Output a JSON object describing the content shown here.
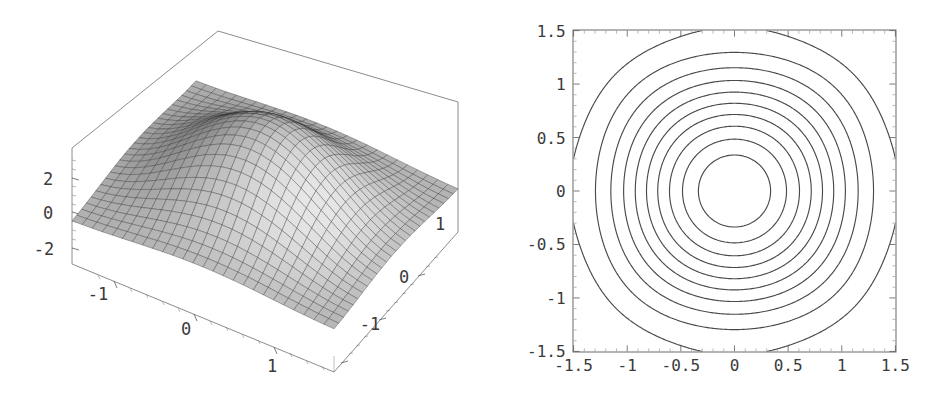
{
  "figure": {
    "background": "#ffffff",
    "ink": "#3a3a3a",
    "panels": [
      "surface-plot",
      "contour-plot"
    ]
  },
  "surface_plot": {
    "name": "3d-surface-plot",
    "z_axis": {
      "ticks": [
        "2",
        "0",
        "-2"
      ],
      "values": [
        2,
        0,
        -2
      ]
    },
    "x_axis": {
      "ticks": [
        "-1",
        "0",
        "1"
      ],
      "values": [
        -1,
        0,
        1
      ]
    },
    "y_axis": {
      "ticks": [
        "1",
        "0",
        "-1"
      ],
      "values": [
        1,
        0,
        -1
      ]
    },
    "mesh": {
      "face_color": "#b9b9b9",
      "line_color": "#2b2b2b",
      "rows": 26,
      "cols": 26
    },
    "box_color": "#6e6e6e"
  },
  "chart_data": {
    "type": "line",
    "title": "",
    "subtitle": "",
    "xlabel": "",
    "ylabel": "",
    "grid": false,
    "legend": null,
    "panels": [
      {
        "id": "surface",
        "type": "surface",
        "description": "3D mesh surface over square domain with four extrema; saddle ridges run diagonally",
        "xlim": [
          -1.5,
          1.5
        ],
        "ylim": [
          -1.5,
          1.5
        ],
        "zlim": [
          -3,
          3
        ],
        "xticks": [
          -1,
          0,
          1
        ],
        "yticks": [
          1,
          0,
          -1
        ],
        "zticks": [
          2,
          0,
          -2
        ],
        "xticklabels": [
          "-1",
          "0",
          "1"
        ],
        "yticklabels": [
          "1",
          "0",
          "-1"
        ],
        "zticklabels": [
          "2",
          "0",
          "-2"
        ]
      },
      {
        "id": "contour",
        "type": "contour",
        "description": "Contour map with closed maxima loops at (0,1), (-1,-1), (1,-1) and saddles near (±1,±1) corners",
        "xlim": [
          -1.5,
          1.5
        ],
        "ylim": [
          -1.5,
          1.5
        ],
        "xticks": [
          -1.5,
          -1,
          -0.5,
          0,
          0.5,
          1,
          1.5
        ],
        "yticks": [
          -1.5,
          -1,
          -0.5,
          0,
          0.5,
          1,
          1.5
        ],
        "xticklabels": [
          "-1.5",
          "-1",
          "-0.5",
          "0",
          "0.5",
          "1",
          "1.5"
        ],
        "yticklabels": [
          "-1.5",
          "-1",
          "-0.5",
          "0",
          "0.5",
          "1",
          "1.5"
        ],
        "minor_ticks_per_interval": 5,
        "n_levels": 10,
        "line_color": "#4a4a4a",
        "frame": true,
        "closed_loop_centers": [
          [
            0,
            1
          ],
          [
            -1,
            -1
          ],
          [
            1,
            -1
          ]
        ]
      }
    ]
  },
  "contour_plot": {
    "name": "contour-plot",
    "x_ticks": [
      "-1.5",
      "-1",
      "-0.5",
      "0",
      "0.5",
      "1",
      "1.5"
    ],
    "y_ticks": [
      "1.5",
      "1",
      "0.5",
      "0",
      "-0.5",
      "-1",
      "-1.5"
    ],
    "frame_color": "#5a5a5a",
    "line_color": "#4a4a4a"
  }
}
